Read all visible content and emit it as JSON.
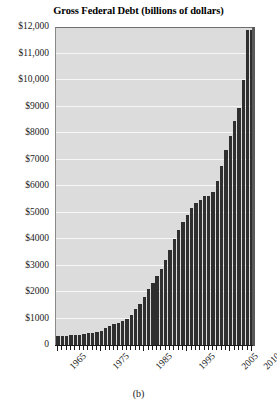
{
  "chart_data": {
    "type": "bar",
    "title": "Gross Federal Debt (billions of dollars)",
    "caption": "(b)",
    "xlabel": "",
    "ylabel": "",
    "ylim": [
      0,
      12000
    ],
    "grid": true,
    "legend": false,
    "bar_color": "#2f2f2f",
    "plot_background": "#dcdcdc",
    "gridline_color": "#f7f7f7",
    "y_ticks": [
      0,
      1000,
      2000,
      3000,
      4000,
      5000,
      6000,
      7000,
      8000,
      9000,
      10000,
      11000,
      12000
    ],
    "y_tick_labels": [
      "0",
      "$1000",
      "$2000",
      "$3000",
      "$4000",
      "$5000",
      "$6000",
      "$7000",
      "$8000",
      "$9000",
      "$10,000",
      "$11,000",
      "$12,000"
    ],
    "x_tick_labels": [
      "1965",
      "1975",
      "1985",
      "1995",
      "2005",
      "2010"
    ],
    "x_tick_label_years": [
      1965,
      1975,
      1985,
      1995,
      2005,
      2010
    ],
    "categories": [
      1965,
      1966,
      1967,
      1968,
      1969,
      1970,
      1971,
      1972,
      1973,
      1974,
      1975,
      1976,
      1977,
      1978,
      1979,
      1980,
      1981,
      1982,
      1983,
      1984,
      1985,
      1986,
      1987,
      1988,
      1989,
      1990,
      1991,
      1992,
      1993,
      1994,
      1995,
      1996,
      1997,
      1998,
      1999,
      2000,
      2001,
      2002,
      2003,
      2004,
      2005,
      2006,
      2007,
      2008,
      2009,
      2010
    ],
    "values": [
      323,
      329,
      341,
      370,
      367,
      381,
      408,
      436,
      466,
      484,
      542,
      629,
      706,
      777,
      829,
      909,
      995,
      1137,
      1371,
      1564,
      1817,
      2120,
      2346,
      2601,
      2868,
      3206,
      3598,
      4002,
      4351,
      4643,
      4921,
      5181,
      5369,
      5478,
      5606,
      5628,
      5769,
      6198,
      6760,
      7355,
      7905,
      8451,
      8951,
      9986,
      11876,
      11900
    ]
  }
}
